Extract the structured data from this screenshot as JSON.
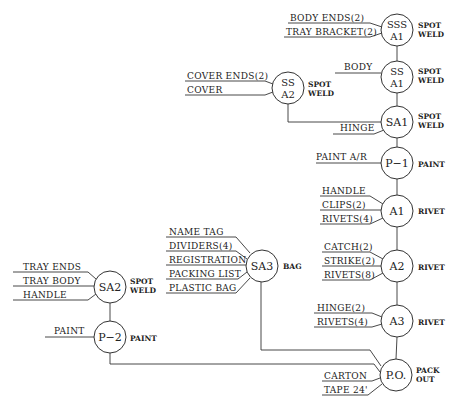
{
  "diagram_type": "assembly flow chart",
  "nodes": [
    {
      "id": "SSS_A1",
      "line1": "SSS",
      "line2": "A1",
      "operation": [
        "SPOT",
        "WELD"
      ],
      "inputs": [
        "BODY ENDS(2)",
        "TRAY BRACKET(2)"
      ]
    },
    {
      "id": "SS_A1",
      "line1": "SS",
      "line2": "A1",
      "operation": [
        "SPOT",
        "WELD"
      ],
      "inputs": [
        "BODY"
      ]
    },
    {
      "id": "SS_A2",
      "line1": "SS",
      "line2": "A2",
      "operation": [
        "SPOT",
        "WELD"
      ],
      "inputs": [
        "COVER ENDS(2)",
        "COVER"
      ]
    },
    {
      "id": "SA1",
      "line1": "SA1",
      "line2": "",
      "operation": [
        "SPOT",
        "WELD"
      ],
      "inputs": [
        "HINGE"
      ]
    },
    {
      "id": "P1",
      "line1": "P−1",
      "line2": "",
      "operation": [
        "PAINT"
      ],
      "inputs": [
        "PAINT A/R"
      ]
    },
    {
      "id": "A1",
      "line1": "A1",
      "line2": "",
      "operation": [
        "RIVET"
      ],
      "inputs": [
        "HANDLE",
        "CLIPS(2)",
        "RIVETS(4)"
      ]
    },
    {
      "id": "A2",
      "line1": "A2",
      "line2": "",
      "operation": [
        "RIVET"
      ],
      "inputs": [
        "CATCH(2)",
        "STRIKE(2)",
        "RIVETS(8)"
      ]
    },
    {
      "id": "A3",
      "line1": "A3",
      "line2": "",
      "operation": [
        "RIVET"
      ],
      "inputs": [
        "HINGE(2)",
        "RIVETS(4)"
      ]
    },
    {
      "id": "SA3",
      "line1": "SA3",
      "line2": "",
      "operation": [
        "BAG"
      ],
      "inputs": [
        "NAME TAG",
        "DIVIDERS(4)",
        "REGISTRATION",
        "PACKING LIST",
        "PLASTIC BAG"
      ]
    },
    {
      "id": "SA2",
      "line1": "SA2",
      "line2": "",
      "operation": [
        "SPOT",
        "WELD"
      ],
      "inputs": [
        "TRAY ENDS",
        "TRAY BODY",
        "HANDLE"
      ]
    },
    {
      "id": "P2",
      "line1": "P−2",
      "line2": "",
      "operation": [
        "PAINT"
      ],
      "inputs": [
        "PAINT"
      ]
    },
    {
      "id": "PO",
      "line1": "P.O.",
      "line2": "",
      "operation": [
        "PACK",
        "OUT"
      ],
      "inputs": [
        "CARTON",
        "TAPE 24'"
      ]
    }
  ],
  "connections": [
    [
      "SSS_A1",
      "SS_A1"
    ],
    [
      "SS_A1",
      "SA1"
    ],
    [
      "SS_A2",
      "SA1"
    ],
    [
      "SA1",
      "P1"
    ],
    [
      "P1",
      "A1"
    ],
    [
      "A1",
      "A2"
    ],
    [
      "A2",
      "A3"
    ],
    [
      "A3",
      "PO"
    ],
    [
      "SA3",
      "PO"
    ],
    [
      "SA2",
      "P2"
    ],
    [
      "P2",
      "PO"
    ]
  ]
}
